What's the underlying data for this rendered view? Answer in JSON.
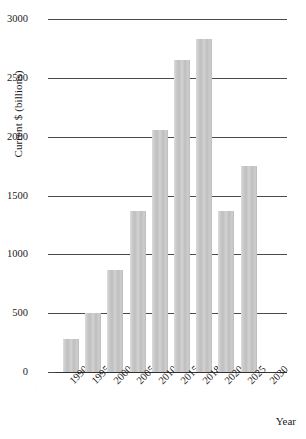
{
  "chart_data": {
    "type": "bar",
    "title": "",
    "xlabel": "Year",
    "ylabel": "Current $ (billions)",
    "categories": [
      "1990",
      "1995",
      "2000",
      "2005",
      "2010",
      "2015",
      "2018",
      "2020",
      "2025",
      "2030"
    ],
    "values": [
      280,
      500,
      870,
      1370,
      2060,
      2650,
      2830,
      1370,
      1750,
      null
    ],
    "ylim": [
      0,
      3000
    ],
    "yticks": [
      0,
      500,
      1000,
      1500,
      2000,
      2500,
      3000
    ],
    "ytick_labels": [
      "0",
      "500",
      "1000",
      "1500",
      "2000",
      "2500",
      "3000"
    ],
    "grid": true,
    "legend": false,
    "bar_color": "#c6c6c6",
    "axis_color": "#4a4a4a"
  }
}
